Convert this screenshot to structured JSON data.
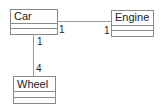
{
  "diagram": {
    "type": "uml-class-diagram",
    "classes": [
      {
        "id": "car",
        "name": "Car"
      },
      {
        "id": "engine",
        "name": "Engine"
      },
      {
        "id": "wheel",
        "name": "Wheel"
      }
    ],
    "associations": [
      {
        "from": "car",
        "to": "engine",
        "from_multiplicity": "1",
        "to_multiplicity": "1"
      },
      {
        "from": "car",
        "to": "wheel",
        "from_multiplicity": "1",
        "to_multiplicity": "4"
      }
    ]
  },
  "colors": {
    "border": "#8a8a8a",
    "line": "#9a9a9a",
    "text": "#222222",
    "background": "#ffffff"
  }
}
